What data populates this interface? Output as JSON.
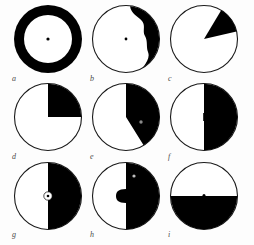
{
  "figure": {
    "background_color": "#fdfdfd",
    "fill_color": "#000000",
    "outline_color": "#1a1a1a",
    "label_color": "#4a4a4a",
    "panel_count": 9,
    "rows": 3,
    "columns": 3
  },
  "panels": [
    {
      "label": "a",
      "name": "panel-a",
      "pattern": "annulus",
      "description": "Thick black ring (annulus) with white interior and small central black dot",
      "black_fraction": 0.55,
      "has_center_dot": true,
      "center_dot_color": "#000000"
    },
    {
      "label": "b",
      "name": "panel-b",
      "pattern": "irregular-crescent-right",
      "description": "Outlined circle with irregular wavy black crescent along the right margin, widest at upper right",
      "black_fraction": 0.18,
      "has_center_dot": true,
      "center_dot_color": "#000000"
    },
    {
      "label": "c",
      "name": "panel-c",
      "pattern": "narrow-wedge",
      "description": "Outlined circle with a narrow black wedge in the upper-right radiating from the centre",
      "black_fraction": 0.12,
      "sector_start_deg": 30,
      "sector_end_deg": 78,
      "has_center_dot": false
    },
    {
      "label": "d",
      "name": "panel-d",
      "pattern": "quarter",
      "description": "Outlined circle with the upper-right quadrant filled black",
      "black_fraction": 0.25,
      "sector_start_deg": 0,
      "sector_end_deg": 90,
      "has_center_dot": false
    },
    {
      "label": "e",
      "name": "panel-e",
      "pattern": "sector-40-percent",
      "description": "Outlined circle with black sector from twelve o'clock clockwise to about five o'clock, small light dot inside the black field",
      "black_fraction": 0.41,
      "sector_start_deg": 0,
      "sector_end_deg": 148,
      "has_center_dot": false,
      "has_inner_speck": true,
      "inner_speck_color": "#8a8a8a"
    },
    {
      "label": "f",
      "name": "panel-f",
      "pattern": "half-vertical",
      "description": "Outlined circle split vertically, right half black",
      "black_fraction": 0.5,
      "sector_start_deg": 0,
      "sector_end_deg": 180,
      "has_center_dot": false
    },
    {
      "label": "g",
      "name": "panel-g",
      "pattern": "half-vertical-with-vesicle",
      "description": "Right half black with a small white circle straddling the dividing line at the centre, containing a tiny black dot",
      "black_fraction": 0.5,
      "sector_start_deg": 0,
      "sector_end_deg": 180,
      "has_center_vesicle": true,
      "vesicle_color": "#ffffff",
      "has_center_dot": true
    },
    {
      "label": "h",
      "name": "panel-h",
      "pattern": "half-vertical-with-bulge",
      "description": "Right half black with a rounded black bulge protruding into the white left half at mid-height, and a small pale speck high in the black field",
      "black_fraction": 0.53,
      "sector_start_deg": 0,
      "sector_end_deg": 180,
      "has_bulge": true,
      "has_inner_speck": true,
      "inner_speck_color": "#bdbdbd"
    },
    {
      "label": "i",
      "name": "panel-i",
      "pattern": "half-horizontal",
      "description": "Outlined circle split horizontally, lower half black, with a tiny dot on the dividing line",
      "black_fraction": 0.5,
      "sector_start_deg": 90,
      "sector_end_deg": 270,
      "has_center_dot": true,
      "center_dot_color": "#000000"
    }
  ]
}
